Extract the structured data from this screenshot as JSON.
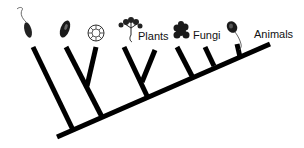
{
  "diagram": {
    "type": "phylogenetic-tree",
    "line_color": "#000000",
    "labels": {
      "plants": "Plants",
      "fungi": "Fungi",
      "animals": "Animals"
    },
    "taxa": [
      {
        "name": "flagellate-protist",
        "icon": "euglena-icon"
      },
      {
        "name": "ciliate-protist",
        "icon": "paramecium-icon"
      },
      {
        "name": "radiolarian-protist",
        "icon": "foraminifera-icon"
      },
      {
        "name": "plant",
        "icon": "plant-icon",
        "label": "Plants"
      },
      {
        "name": "fungus",
        "icon": "fungus-icon",
        "label": "Fungi"
      },
      {
        "name": "animal",
        "icon": "choanoflagellate-icon",
        "label": "Animals"
      }
    ]
  }
}
